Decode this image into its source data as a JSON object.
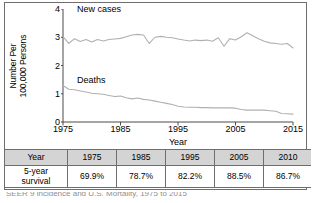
{
  "figure": {
    "y_axis_title_line1": "Number Per",
    "y_axis_title_line2": "100,000 Persons",
    "x_axis_title": "Year",
    "label_new_cases": "New cases",
    "label_deaths": "Deaths",
    "caption": "SEER 9 incidence and U.S. Mortality, 1975 to 2015"
  },
  "table": {
    "header": [
      "Year",
      "1975",
      "1985",
      "1995",
      "2005",
      "2010"
    ],
    "row_label": "5-year survival",
    "row_label_line1": "5-year",
    "row_label_line2": "survival",
    "values": [
      "69.9%",
      "78.7%",
      "82.2%",
      "88.5%",
      "86.7%"
    ]
  },
  "colors": {
    "line": "#b0b0b0",
    "axis": "#4a4a4a",
    "frame": "#6e6e6e",
    "table_header_bg": "#d4d4d4"
  },
  "chart_data": {
    "type": "line",
    "title": "",
    "xlabel": "Year",
    "ylabel": "Number Per 100,000 Persons",
    "xlim": [
      1975,
      2015
    ],
    "ylim": [
      0,
      4
    ],
    "yticks": [
      0,
      1,
      2,
      3,
      4
    ],
    "xticks": [
      1975,
      1985,
      1995,
      2005,
      2015
    ],
    "grid": false,
    "legend": "inline-labels",
    "x": [
      1975,
      1976,
      1977,
      1978,
      1979,
      1980,
      1981,
      1982,
      1983,
      1984,
      1985,
      1986,
      1987,
      1988,
      1989,
      1990,
      1991,
      1992,
      1993,
      1994,
      1995,
      1996,
      1997,
      1998,
      1999,
      2000,
      2001,
      2002,
      2003,
      2004,
      2005,
      2006,
      2007,
      2008,
      2009,
      2010,
      2011,
      2012,
      2013,
      2014,
      2015
    ],
    "series": [
      {
        "name": "New cases",
        "values": [
          3.02,
          2.78,
          2.95,
          2.85,
          2.92,
          2.83,
          2.92,
          2.87,
          2.92,
          2.94,
          2.96,
          3.02,
          3.08,
          3.1,
          3.08,
          2.78,
          3.0,
          3.03,
          3.0,
          2.98,
          2.94,
          2.9,
          2.87,
          2.9,
          2.88,
          2.9,
          2.86,
          2.98,
          2.68,
          2.95,
          2.9,
          3.02,
          3.16,
          3.05,
          2.95,
          2.86,
          2.8,
          2.78,
          2.75,
          2.78,
          2.62
        ]
      },
      {
        "name": "Deaths",
        "values": [
          1.29,
          1.16,
          1.14,
          1.1,
          1.06,
          1.02,
          1.0,
          0.98,
          0.94,
          0.9,
          0.92,
          0.86,
          0.82,
          0.85,
          0.8,
          0.78,
          0.74,
          0.7,
          0.66,
          0.62,
          0.56,
          0.53,
          0.52,
          0.52,
          0.51,
          0.51,
          0.5,
          0.5,
          0.5,
          0.5,
          0.49,
          0.44,
          0.42,
          0.42,
          0.42,
          0.42,
          0.4,
          0.38,
          0.3,
          0.29,
          0.28
        ]
      }
    ]
  }
}
